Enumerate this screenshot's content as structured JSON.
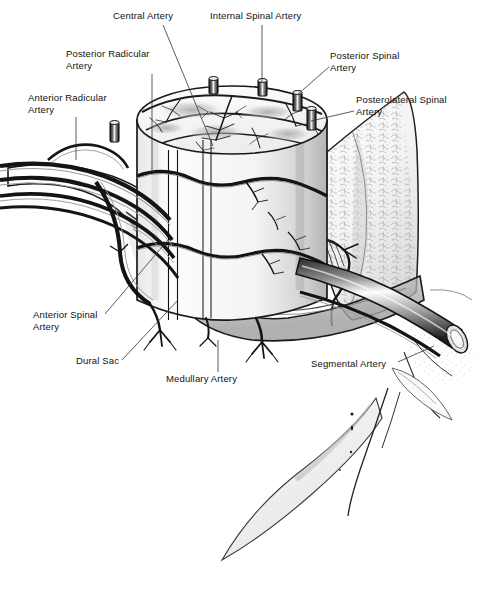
{
  "figure": {
    "width": 500,
    "height": 615,
    "background": "#ffffff",
    "ink": "#111111",
    "style": "pen-and-ink medical illustration, grayscale stipple and line hatching"
  },
  "labels": [
    {
      "id": "central-artery",
      "text": "Central Artery",
      "x": 113,
      "y": 10,
      "align": "left",
      "leader": [
        [
          163,
          25
        ],
        [
          213,
          146
        ]
      ]
    },
    {
      "id": "internal-spinal-artery",
      "text": "Internal Spinal Artery",
      "x": 210,
      "y": 10,
      "align": "left",
      "leader": [
        [
          262,
          25
        ],
        [
          262,
          82
        ]
      ]
    },
    {
      "id": "posterior-radicular-artery",
      "text": "Posterior Radicular\nArtery",
      "x": 66,
      "y": 48,
      "align": "left",
      "leader": [
        [
          152,
          74
        ],
        [
          152,
          172
        ]
      ]
    },
    {
      "id": "posterior-spinal-artery",
      "text": "Posterior Spinal\nArtery",
      "x": 330,
      "y": 50,
      "align": "left",
      "leader": [
        [
          329,
          67
        ],
        [
          297,
          95
        ]
      ]
    },
    {
      "id": "anterior-radicular-artery",
      "text": "Anterior Radicular\nArtery",
      "x": 28,
      "y": 92,
      "align": "left",
      "leader": [
        [
          76,
          117
        ],
        [
          76,
          160
        ]
      ]
    },
    {
      "id": "posterolateral-spinal-artery",
      "text": "Posterolateral Spinal\nArtery",
      "x": 356,
      "y": 94,
      "align": "left",
      "leader": [
        [
          354,
          111
        ],
        [
          311,
          121
        ]
      ]
    },
    {
      "id": "anterior-spinal-artery",
      "text": "Anterior Spinal\nArtery",
      "x": 33,
      "y": 309,
      "align": "left",
      "leader": [
        [
          105,
          314
        ],
        [
          168,
          240
        ]
      ]
    },
    {
      "id": "dural-sac",
      "text": "Dural Sac",
      "x": 76,
      "y": 355,
      "align": "left",
      "leader": [
        [
          122,
          360
        ],
        [
          178,
          300
        ]
      ]
    },
    {
      "id": "medullary-artery",
      "text": "Medullary Artery",
      "x": 166,
      "y": 373,
      "align": "left",
      "leader": [
        [
          218,
          372
        ],
        [
          218,
          340
        ]
      ]
    },
    {
      "id": "segmental-artery",
      "text": "Segmental Artery",
      "x": 311,
      "y": 358,
      "align": "left",
      "leader": [
        [
          398,
          362
        ],
        [
          434,
          346
        ]
      ]
    }
  ],
  "structures": [
    {
      "id": "spinal-cord-segment",
      "description": "Vertical cylindrical spinal cord segment with cut top surface showing lobed gray matter"
    },
    {
      "id": "cord-top-cross-section",
      "description": "Elliptical cut surface of cord with butterfly gray matter and dendritic arterial branching"
    },
    {
      "id": "vessel-stub-1",
      "description": "Cut vessel stump on posterior cord surface"
    },
    {
      "id": "vessel-stub-2",
      "description": "Cut vessel stump on posterior cord surface"
    },
    {
      "id": "vessel-stub-3",
      "description": "Cut vessel stump on posterolateral cord surface"
    },
    {
      "id": "vessel-stub-4",
      "description": "Cut vessel stump on lateral cord surface"
    },
    {
      "id": "dural-sac-membrane",
      "description": "Translucent dural sac enveloping cord, opened anteriorly"
    },
    {
      "id": "dentate-ligament",
      "description": "Radiating fibrous bands between cord and dura"
    },
    {
      "id": "vertebral-body",
      "description": "Cancellous bone of vertebral body, stippled trabecular texture"
    },
    {
      "id": "segmental-artery-trunk",
      "description": "Large transected artery entering from lateral right"
    },
    {
      "id": "nerve-root-bundle",
      "description": "Paired vessel and root bundles exiting left"
    },
    {
      "id": "medullary-branches",
      "description": "Small branching vessels descending below dural sac"
    },
    {
      "id": "lower-vertebral-process",
      "description": "Faintly shaded bony process descending to lower right"
    }
  ]
}
